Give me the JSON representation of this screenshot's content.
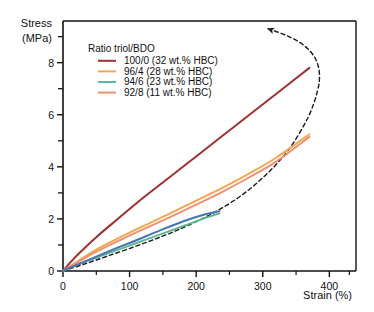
{
  "chart_data": {
    "type": "line",
    "title": "",
    "xlabel": "Strain (%)",
    "ylabel_line1": "Stress",
    "ylabel_line2": "(MPa)",
    "xlim": [
      0,
      440
    ],
    "ylim": [
      0,
      9.6
    ],
    "xticks": [
      0,
      100,
      200,
      300,
      400
    ],
    "xtick_labels": [
      "0",
      "100",
      "200",
      "300",
      "400"
    ],
    "yticks": [
      0,
      2,
      4,
      6,
      8
    ],
    "ytick_labels": [
      "0",
      "2",
      "4",
      "6",
      "8"
    ],
    "yminorticks": [
      1,
      3,
      5,
      7,
      9
    ],
    "grid": false,
    "legend_position": "upper-left-inside",
    "legend_title": "Ratio triol/BDO",
    "series": [
      {
        "name": "100/0 (32 wt.% HBC)",
        "color": "#a03030",
        "style": "solid",
        "in_legend": true,
        "x": [
          0,
          10,
          25,
          50,
          80,
          120,
          160,
          200,
          240,
          280,
          320,
          370
        ],
        "y": [
          0,
          0.3,
          0.7,
          1.3,
          1.95,
          2.8,
          3.6,
          4.4,
          5.2,
          6.0,
          6.8,
          7.8
        ]
      },
      {
        "name": "96/4 (28 wt.% HBC)",
        "color": "#f0a850",
        "style": "solid",
        "in_legend": true,
        "x": [
          0,
          10,
          25,
          50,
          80,
          120,
          160,
          200,
          240,
          280,
          320,
          370
        ],
        "y": [
          0,
          0.18,
          0.42,
          0.82,
          1.22,
          1.72,
          2.2,
          2.7,
          3.2,
          3.75,
          4.35,
          5.25
        ]
      },
      {
        "name": "94/6 (23 wt.% HBC)",
        "color": "#5cb890",
        "style": "solid",
        "in_legend": true,
        "x": [
          0,
          8,
          20,
          40,
          70,
          100,
          140,
          180,
          215,
          235
        ],
        "y": [
          0,
          0.1,
          0.22,
          0.42,
          0.7,
          0.98,
          1.35,
          1.72,
          2.05,
          2.22
        ]
      },
      {
        "name": "92/8 (11 wt.% HBC)",
        "color": "#f09070",
        "style": "solid",
        "in_legend": true,
        "x": [
          0,
          10,
          25,
          50,
          80,
          120,
          160,
          200,
          240,
          280,
          320,
          370
        ],
        "y": [
          0,
          0.16,
          0.38,
          0.74,
          1.12,
          1.6,
          2.06,
          2.55,
          3.05,
          3.6,
          4.2,
          5.15
        ]
      },
      {
        "name": "unlabeled-blue-curve",
        "color": "#4a72b8",
        "style": "solid",
        "in_legend": false,
        "x": [
          0,
          10,
          25,
          50,
          80,
          110,
          145,
          180,
          210,
          235
        ],
        "y": [
          0,
          0.12,
          0.28,
          0.55,
          0.88,
          1.18,
          1.55,
          1.9,
          2.15,
          2.3
        ]
      },
      {
        "name": "recovery-arrow-curve",
        "color": "#1a1a1a",
        "style": "dashed",
        "arrow": true,
        "in_legend": false,
        "x": [
          0,
          30,
          70,
          120,
          170,
          220,
          265,
          305,
          340,
          368,
          382,
          385,
          378,
          360,
          335,
          308
        ],
        "y": [
          0,
          0.25,
          0.6,
          1.05,
          1.55,
          2.15,
          2.85,
          3.7,
          4.7,
          5.9,
          6.9,
          7.6,
          8.2,
          8.7,
          9.05,
          9.3
        ]
      }
    ]
  }
}
